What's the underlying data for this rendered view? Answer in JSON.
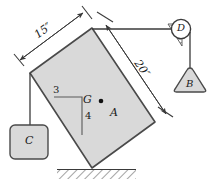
{
  "figure": {
    "type": "engineering-free-body-diagram",
    "canvas": {
      "width": 210,
      "height": 196
    },
    "colors": {
      "block_fill": "#d9d9d9",
      "block_stroke": "#4a4a4a",
      "line": "#3a3a3a",
      "text": "#1a1a1a",
      "hatch": "#555555",
      "background": "#ffffff"
    }
  },
  "labels": {
    "dim_top_left": "15″",
    "dim_right": "20″",
    "block_main": "A",
    "center_of_gravity": "G",
    "slope_run": "3",
    "slope_rise": "4",
    "pulley": "D",
    "weight_right": "B",
    "weight_left": "C"
  },
  "geometry": {
    "block_vertices": [
      [
        92,
        28
      ],
      [
        155,
        122
      ],
      [
        92,
        168
      ],
      [
        30,
        73
      ]
    ],
    "cg_point": [
      101,
      101
    ],
    "cg_label_pos": [
      84,
      95
    ],
    "pulley_center": [
      180,
      29
    ],
    "pulley_radius": 10,
    "weight_b_center": [
      180,
      80
    ],
    "weight_c_center": [
      30,
      140
    ],
    "ground_y": 170
  },
  "annotations": {
    "dim_15_line": {
      "from": [
        16,
        62
      ],
      "to": [
        84,
        14
      ],
      "label_angle": -35
    },
    "dim_20_line": {
      "from": [
        104,
        19
      ],
      "to": [
        167,
        113
      ],
      "label_angle": 56
    },
    "cable_top": {
      "from": [
        92,
        29
      ],
      "to": [
        172,
        29
      ]
    },
    "cable_pulley_to_b": {
      "from": [
        182,
        38
      ],
      "to": [
        182,
        66
      ]
    },
    "cable_left_to_c": {
      "from": [
        30,
        73
      ],
      "to": [
        30,
        124
      ]
    }
  }
}
